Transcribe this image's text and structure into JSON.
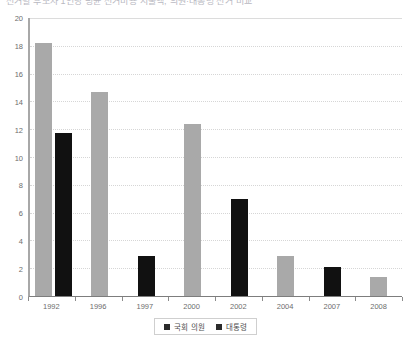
{
  "caption": {
    "text": "선거별 후보자 1인당 평균 선거비용 지출액, 의원·대통령 선거 비교"
  },
  "chart_data": {
    "type": "bar",
    "title": "",
    "subtitle": "",
    "xlabel": "",
    "ylabel": "",
    "categories": [
      "1992",
      "1996",
      "1997",
      "2000",
      "2002",
      "2004",
      "2007",
      "2008"
    ],
    "series": [
      {
        "name": "국회 의원",
        "color": "#a9a9a9",
        "values": [
          18.2,
          14.7,
          null,
          12.4,
          null,
          2.9,
          null,
          1.4
        ]
      },
      {
        "name": "대통령",
        "color": "#111111",
        "values": [
          11.7,
          null,
          2.9,
          null,
          7.0,
          null,
          2.1,
          null
        ]
      }
    ],
    "ylim": [
      0,
      20
    ],
    "ytick_step": 2,
    "yticks": [
      "20",
      "18",
      "16",
      "14",
      "12",
      "10",
      "8",
      "6",
      "4",
      "2",
      "0"
    ],
    "grid": true,
    "grid_axis": "y",
    "legend_position": "bottom"
  },
  "legend": {
    "entries": [
      {
        "label": "국회 의원",
        "swatch": "legend-swatch-assembly"
      },
      {
        "label": "대통령",
        "swatch": "legend-swatch-president"
      }
    ]
  }
}
